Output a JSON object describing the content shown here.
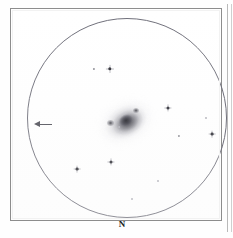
{
  "figure": {
    "type": "astronomical-observing-sketch",
    "medium": "eyepiece field of view sketch",
    "background_color": "#ffffff",
    "ink_color": "#2c2c33",
    "frame_color": "#8d8d8d",
    "circle_color": "#6f6f7a"
  },
  "frame": {
    "x": 10,
    "y": 8,
    "width": 212,
    "height": 213
  },
  "field_of_view": {
    "label": "eyepiece-field-circle",
    "center_x": 116,
    "center_y": 117,
    "radius": 100
  },
  "orientation": {
    "north_label": "N",
    "north_position": "bottom-center",
    "arrow_label": "direction-arrow",
    "arrow_direction": "left",
    "arrow_x": 23,
    "arrow_y": 113
  },
  "deep_sky_object": {
    "name": "diffuse-nebulous-object",
    "morphology": "elongated glow with bright stellar core",
    "center_x": 115,
    "center_y": 112,
    "position_angle_deg": -28
  },
  "stars": [
    {
      "x": 93,
      "y": 68,
      "size": 2.2,
      "class": "faint"
    },
    {
      "x": 109,
      "y": 68,
      "size": 3.4,
      "class": ""
    },
    {
      "x": 167,
      "y": 107,
      "size": 3.0,
      "class": ""
    },
    {
      "x": 205,
      "y": 117,
      "size": 2.0,
      "class": "vfaint"
    },
    {
      "x": 211,
      "y": 133,
      "size": 2.8,
      "class": ""
    },
    {
      "x": 178,
      "y": 135,
      "size": 2.2,
      "class": "faint"
    },
    {
      "x": 118,
      "y": 126,
      "size": 1.8,
      "class": "vfaint"
    },
    {
      "x": 110,
      "y": 161,
      "size": 3.0,
      "class": ""
    },
    {
      "x": 76,
      "y": 168,
      "size": 2.8,
      "class": ""
    },
    {
      "x": 157,
      "y": 180,
      "size": 2.0,
      "class": "vfaint"
    },
    {
      "x": 131,
      "y": 198,
      "size": 2.0,
      "class": "vfaint"
    }
  ],
  "chart_data": {
    "type": "scatter",
    "title": "",
    "xlabel": "",
    "ylabel": "",
    "grid": false,
    "legend": null,
    "annotations": [
      {
        "text": "N",
        "x": 113,
        "y": 221,
        "role": "north-direction-label"
      },
      {
        "text": "",
        "x": 32,
        "y": 113,
        "role": "direction-arrow-pointing-left"
      }
    ],
    "series": [
      {
        "name": "field stars",
        "x": [
          93,
          109,
          167,
          205,
          211,
          178,
          118,
          110,
          76,
          157,
          131
        ],
        "y": [
          68,
          68,
          107,
          117,
          133,
          135,
          126,
          161,
          168,
          180,
          198
        ],
        "sizes": [
          2.2,
          3.4,
          3.0,
          2.0,
          2.8,
          2.2,
          1.8,
          3.0,
          2.8,
          2.0,
          2.0
        ]
      },
      {
        "name": "deep sky object",
        "x": [
          115
        ],
        "y": [
          112
        ],
        "sizes": [
          46
        ]
      }
    ]
  }
}
